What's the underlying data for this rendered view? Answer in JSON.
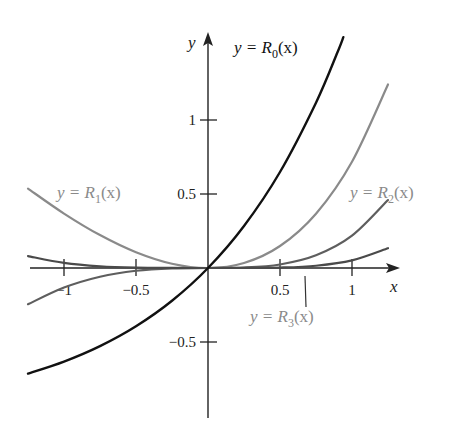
{
  "chart_data": {
    "type": "line",
    "title": "",
    "xlabel": "x",
    "ylabel": "y",
    "xlim": [
      -1.25,
      1.3
    ],
    "ylim": [
      -0.9,
      1.6
    ],
    "grid": false,
    "legend": "inline labels",
    "x_ticks": [
      "-1",
      "-0.5",
      "0.5",
      "1"
    ],
    "y_ticks": [
      "-0.5",
      "0.5",
      "1"
    ],
    "series": [
      {
        "name": "y = R0(x)",
        "color": "#111111",
        "x": [
          -1.25,
          -1,
          -0.75,
          -0.5,
          -0.25,
          0,
          0.25,
          0.5,
          0.75,
          0.9,
          0.94
        ],
        "values": [
          -0.7135,
          -0.6321,
          -0.5276,
          -0.3935,
          -0.2212,
          0,
          0.284,
          0.6487,
          1.117,
          1.4596,
          1.56
        ]
      },
      {
        "name": "y = R1(x)",
        "color": "#8a8a8a",
        "x": [
          -1.25,
          -1,
          -0.75,
          -0.5,
          -0.25,
          0,
          0.25,
          0.5,
          0.75,
          1,
          1.25
        ],
        "values": [
          0.5365,
          0.3679,
          0.2224,
          0.1065,
          0.0288,
          0,
          0.034,
          0.1487,
          0.367,
          0.7183,
          1.2403
        ]
      },
      {
        "name": "y = R2(x)",
        "color": "#5e5e5e",
        "x": [
          -1.25,
          -1,
          -0.75,
          -0.5,
          -0.25,
          0,
          0.25,
          0.5,
          0.75,
          1,
          1.25
        ],
        "values": [
          -0.2448,
          -0.1321,
          -0.0588,
          -0.0185,
          -0.0024,
          0,
          0.0028,
          0.0237,
          0.0857,
          0.2183,
          0.4591
        ]
      },
      {
        "name": "y = R3(x)",
        "color": "#4a4a4a",
        "x": [
          -1.25,
          -1,
          -0.75,
          -0.5,
          -0.25,
          0,
          0.25,
          0.5,
          0.75,
          1,
          1.25
        ],
        "values": [
          0.0807,
          0.0346,
          0.0115,
          0.0023,
          0.0002,
          0,
          0.0002,
          0.0029,
          0.0154,
          0.0516,
          0.1336
        ]
      }
    ],
    "annotations": [
      {
        "text": "y = R0(x)",
        "series": 0
      },
      {
        "text": "y = R1(x)",
        "series": 1
      },
      {
        "text": "y = R2(x)",
        "series": 2
      },
      {
        "text": "y = R3(x)",
        "series": 3
      }
    ]
  },
  "axes": {
    "x_label": "x",
    "y_label": "y",
    "x_ticks": [
      {
        "value": -1,
        "label": "−1"
      },
      {
        "value": -0.5,
        "label": "−0.5"
      },
      {
        "value": 0.5,
        "label": "0.5"
      },
      {
        "value": 1,
        "label": "1"
      }
    ],
    "y_ticks": [
      {
        "value": 1,
        "label": "1"
      },
      {
        "value": 0.5,
        "label": "0.5"
      },
      {
        "value": -0.5,
        "label": "−0.5"
      }
    ]
  },
  "labels": {
    "r0": {
      "prefix": "y = R",
      "sub": "0",
      "suffix": "(x)"
    },
    "r1": {
      "prefix": "y = R",
      "sub": "1",
      "suffix": "(x)"
    },
    "r2": {
      "prefix": "y = R",
      "sub": "2",
      "suffix": "(x)"
    },
    "r3": {
      "prefix": "y = R",
      "sub": "3",
      "suffix": "(x)"
    }
  }
}
